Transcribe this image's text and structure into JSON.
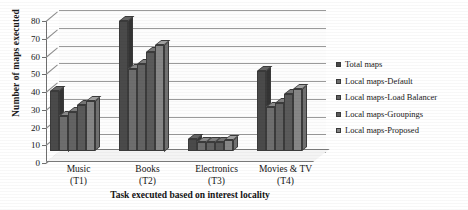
{
  "chart_data": {
    "type": "bar",
    "title": "",
    "xlabel": "Task executed based on interest locality",
    "ylabel": "Number of maps executed",
    "categories": [
      "Music\n(T1)",
      "Books\n(T2)",
      "Electronics\n(T3)",
      "Movies & TV\n(T4)"
    ],
    "category_labels": [
      {
        "name": "Music",
        "code": "(T1)"
      },
      {
        "name": "Books",
        "code": "(T2)"
      },
      {
        "name": "Electronics",
        "code": "(T3)"
      },
      {
        "name": "Movies & TV",
        "code": "(T4)"
      }
    ],
    "series": [
      {
        "name": "Total maps",
        "color": "#4a4a4a",
        "values": [
          34,
          73,
          7,
          45
        ]
      },
      {
        "name": "Local maps-Default",
        "color": "#6e6e6e",
        "values": [
          20,
          46,
          5,
          25
        ]
      },
      {
        "name": "Local maps-Load Balancer",
        "color": "#636363",
        "values": [
          22,
          49,
          5,
          27
        ]
      },
      {
        "name": "Local maps-Groupings",
        "color": "#5a5a5a",
        "values": [
          26,
          56,
          5,
          32
        ]
      },
      {
        "name": "Local maps-Proposed",
        "color": "#868686",
        "values": [
          28,
          60,
          6,
          35
        ]
      }
    ],
    "ylim": [
      0,
      80
    ],
    "yticks": [
      0,
      10,
      20,
      30,
      40,
      50,
      60,
      70,
      80
    ],
    "grid": true,
    "legend_position": "right",
    "style": "3d-clustered-column"
  },
  "axes": {
    "y_title": "Number of maps executed",
    "x_title": "Task executed based on interest locality"
  }
}
